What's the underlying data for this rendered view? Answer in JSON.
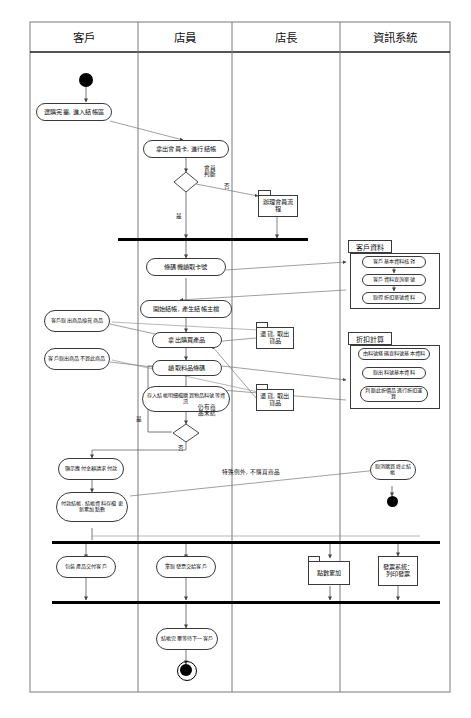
{
  "diagram": {
    "type": "uml-activity-swimlane",
    "frame": {
      "x": 30,
      "y": 22,
      "width": 420,
      "height": 670
    },
    "colors": {
      "line": "#3a3a3a",
      "text": "#111111",
      "fill": "#ffffff",
      "bar": "#000000"
    }
  },
  "lanes": [
    {
      "id": "customer",
      "label": "客戶",
      "x": 30,
      "width": 108
    },
    {
      "id": "clerk",
      "label": "店員",
      "x": 138,
      "width": 94
    },
    {
      "id": "manager",
      "label": "店長",
      "x": 232,
      "width": 108
    },
    {
      "id": "system",
      "label": "資訊系統",
      "x": 340,
      "width": 110
    }
  ],
  "nodes": {
    "start": {
      "label": "start"
    },
    "a_shop_done": {
      "text": "選購完畢, 進入結帳區"
    },
    "a_member_card": {
      "text": "拿出會員卡, 進行結帳"
    },
    "d_member": {
      "text": "",
      "note": "會員判斷"
    },
    "p_member_flow": {
      "text": "辦理會員流程"
    },
    "a_barcode_card": {
      "text": "條碼機讀取卡號"
    },
    "a_begin_checkout": {
      "text": "開始結帳, 產生結帳主檔"
    },
    "a_take_goods": {
      "text": "拿出購買產品"
    },
    "a_read_barcode": {
      "text": "讀取料品條碼"
    },
    "a_save_detail": {
      "text": "存入結帳明細檔購買物品料號等資訊"
    },
    "d_more_items": {
      "text": "",
      "note": "仍有商品未結"
    },
    "a_show_amount": {
      "text": "顯示應付金額請求付款"
    },
    "a_pay": {
      "text": "付款結帳, 結帳資料存檔 更新累加點數"
    },
    "n_customer_exchange": {
      "text": "客戶取出商品換貨商品"
    },
    "n_customer_nobuy": {
      "text": "客戶取出商品不買此商品"
    },
    "p_return_1": {
      "text": "退貨, 取出貨品"
    },
    "p_return_2": {
      "text": "退貨, 取出貨品"
    },
    "a_cancel": {
      "text": "取消購買終止結帳"
    },
    "a_package": {
      "text": "包裝產品交付客戶"
    },
    "a_receipt": {
      "text": "拿取發票交給客戶"
    },
    "p_points": {
      "text": "點數累加"
    },
    "p_invoice": {
      "text": "發票系統：列印發票"
    },
    "a_finish": {
      "text": "結帳完畢等待下一客戶"
    }
  },
  "groups": [
    {
      "id": "customer_data",
      "label": "客戶資料",
      "items": [
        "客戶基本資料核對",
        "客戶資料查詢單號",
        "取得折扣單號資料"
      ]
    },
    {
      "id": "discount_calc",
      "label": "折扣計算",
      "items": [
        "由料號條碼查料號基本資料",
        "取出料號基本資料",
        "判斷此折價品進行折扣運算"
      ]
    }
  ],
  "edge_labels": [
    {
      "id": "member_no",
      "text": "否"
    },
    {
      "id": "member_yes",
      "text": "是"
    },
    {
      "id": "more_yes",
      "text": "是"
    },
    {
      "id": "more_no",
      "text": "否"
    },
    {
      "id": "member_decision",
      "text": "會員\n判斷"
    },
    {
      "id": "item_decision",
      "text": "仍有商\n品未結"
    },
    {
      "id": "exception",
      "text": "特殊例外, 不購買商品"
    }
  ]
}
